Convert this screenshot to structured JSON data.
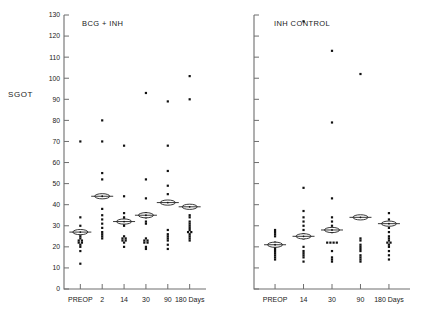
{
  "figure": {
    "y_axis_name": "SGOT",
    "y_ticks": [
      0,
      10,
      20,
      30,
      40,
      50,
      60,
      70,
      80,
      90,
      100,
      110,
      120,
      130
    ],
    "ylim": [
      0,
      130
    ]
  },
  "chart_data": {
    "type": "scatter",
    "title": "",
    "xlabel": "",
    "ylabel": "SGOT",
    "ylim": [
      0,
      130
    ],
    "yticks": [
      0,
      10,
      20,
      30,
      40,
      50,
      60,
      70,
      80,
      90,
      100,
      110,
      120,
      130
    ],
    "grid": false,
    "legend": "none",
    "panels": [
      {
        "name": "BCG + INH",
        "categories": [
          "PREOP",
          "2",
          "14",
          "30",
          "90",
          "180 Days"
        ],
        "groups": [
          {
            "category": "PREOP",
            "mean": 27,
            "values": [
              70,
              34,
              30,
              26,
              25,
              24,
              23,
              23,
              22,
              22,
              21,
              20,
              18,
              12
            ]
          },
          {
            "category": "2",
            "mean": 44,
            "values": [
              80,
              70,
              55,
              52,
              44,
              38,
              35,
              33,
              31,
              29,
              27,
              26,
              25,
              24
            ]
          },
          {
            "category": "14",
            "mean": 32,
            "values": [
              68,
              44,
              36,
              34,
              33,
              31,
              30,
              25,
              24,
              24,
              23,
              23,
              22,
              20
            ]
          },
          {
            "category": "30",
            "mean": 35,
            "values": [
              93,
              52,
              43,
              36,
              34,
              32,
              31,
              24,
              23,
              23,
              22,
              22,
              20,
              19
            ]
          },
          {
            "category": "90",
            "mean": 41,
            "values": [
              89,
              68,
              56,
              49,
              45,
              41,
              41,
              28,
              26,
              25,
              24,
              23,
              21,
              19
            ]
          },
          {
            "category": "180 Days",
            "mean": 39,
            "values": [
              101,
              90,
              35,
              34,
              32,
              31,
              30,
              29,
              28,
              27,
              27,
              26,
              25,
              24,
              23
            ]
          }
        ]
      },
      {
        "name": "INH CONTROL",
        "categories": [
          "PREOP",
          "14",
          "30",
          "90",
          "180 Days"
        ],
        "groups": [
          {
            "category": "PREOP",
            "mean": 21,
            "values": [
              28,
              27,
              26,
              25,
              22,
              21,
              21,
              20,
              19,
              18,
              17,
              16,
              15,
              14
            ]
          },
          {
            "category": "14",
            "mean": 25,
            "values": [
              127,
              48,
              37,
              34,
              32,
              30,
              28,
              26,
              24,
              20,
              18,
              17,
              16,
              15,
              13
            ]
          },
          {
            "category": "30",
            "mean": 28,
            "values": [
              113,
              79,
              43,
              34,
              32,
              30,
              27,
              22,
              22,
              22,
              22,
              18,
              15,
              14,
              13
            ]
          },
          {
            "category": "90",
            "mean": 34,
            "values": [
              102,
              34,
              34,
              24,
              23,
              21,
              20,
              19,
              18,
              16,
              15,
              14,
              13
            ]
          },
          {
            "category": "180 Days",
            "mean": 31,
            "values": [
              36,
              33,
              31,
              29,
              27,
              25,
              24,
              23,
              22,
              22,
              21,
              20,
              18,
              16,
              14
            ]
          }
        ]
      }
    ]
  },
  "colors": {
    "point": "#111111",
    "axis": "#6e6e6e",
    "background": "#ffffff"
  }
}
